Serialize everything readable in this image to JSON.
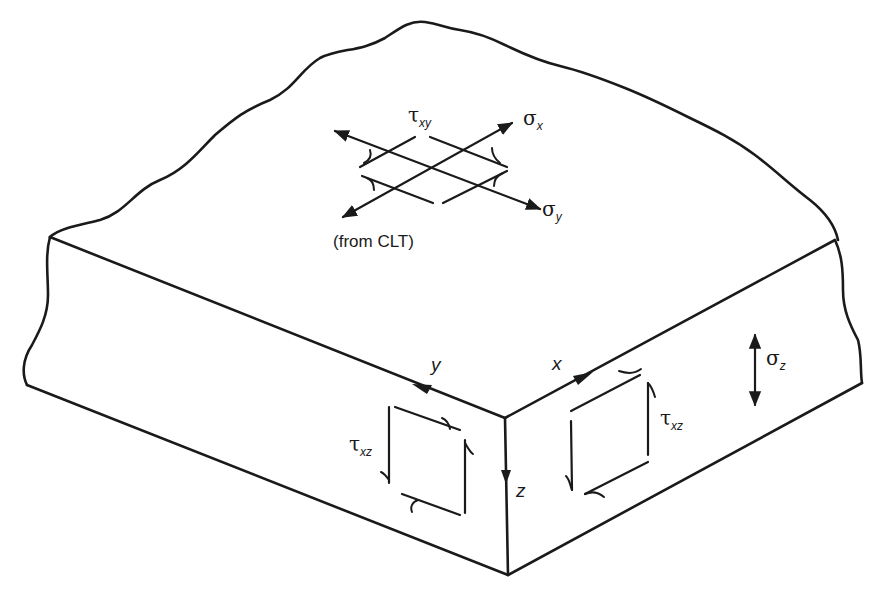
{
  "figure": {
    "top_face": {
      "stress_labels": {
        "shear_xy": {
          "symbol": "τ",
          "subscript": "xy"
        },
        "normal_x": {
          "symbol": "σ",
          "subscript": "x"
        },
        "normal_y": {
          "symbol": "σ",
          "subscript": "y"
        }
      },
      "note": "(from CLT)"
    },
    "axes": {
      "x": "x",
      "y": "y",
      "z": "z"
    },
    "front_left_face": {
      "shear_label": {
        "symbol": "τ",
        "subscript": "xz"
      }
    },
    "front_right_face": {
      "shear_label": {
        "symbol": "τ",
        "subscript": "xz"
      },
      "normal_label": {
        "symbol": "σ",
        "subscript": "z"
      }
    },
    "colors": {
      "line": "#1a1a1a",
      "background": "#ffffff"
    }
  }
}
